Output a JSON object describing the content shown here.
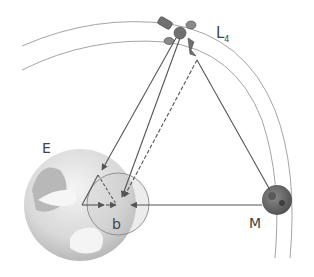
{
  "diagram": {
    "labels": {
      "lagrange_point": "L",
      "lagrange_subscript": "4",
      "earth": "E",
      "moon": "M",
      "barycenter": "b"
    },
    "colors": {
      "line": "#555555",
      "orbit": "#9a9a9a",
      "earth_light": "#eeeeee",
      "earth_dark": "#b5b5b5",
      "moon": "#6b6b6b",
      "satellite": "#707070"
    }
  }
}
